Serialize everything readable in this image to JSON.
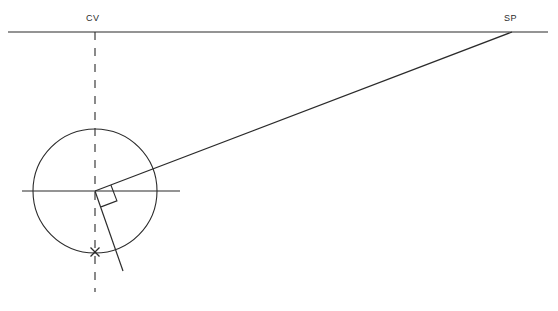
{
  "diagram": {
    "background_color": "#ffffff",
    "stroke_color": "#2b2b2b",
    "width": 558,
    "height": 311,
    "labels": {
      "cv": "CV",
      "sp": "SP"
    },
    "points": {
      "center_of_vision": {
        "x": 95,
        "y": 32
      },
      "station_point": {
        "x": 512,
        "y": 32
      },
      "circle_center": {
        "x": 95,
        "y": 191
      },
      "x_mark": {
        "x": 95,
        "y": 252
      }
    },
    "geometry": {
      "horizon_line": {
        "x1": 8,
        "y1": 32,
        "x2": 548,
        "y2": 32
      },
      "circle": {
        "cx": 95,
        "cy": 191,
        "r": 62
      },
      "horizontal_diameter": {
        "x1": 22,
        "y1": 191,
        "x2": 180,
        "y2": 191
      },
      "vertical_dashed_line": {
        "x": 95,
        "y1": 32,
        "y2": 292,
        "dash": "8 8"
      },
      "sight_line_to_sp": {
        "x1": 95,
        "y1": 191,
        "x2": 512,
        "y2": 32
      },
      "perpendicular_ray": {
        "x1": 95,
        "y1": 191,
        "x2": 123,
        "y2": 271
      },
      "right_angle_marker": {
        "size": 17,
        "rotation_deg": -20.9
      },
      "x_mark_size": 9
    }
  }
}
